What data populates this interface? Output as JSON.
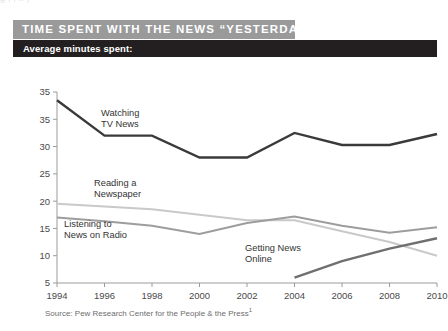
{
  "page": {
    "top_clipped_text": "g  ,            , ff        )"
  },
  "header": {
    "title": "TIME SPENT WITH THE NEWS “YESTERDAY”",
    "subtitle": "Average minutes spent:",
    "title_band_color": "#9a9a9a",
    "subtitle_band_color": "#231f20"
  },
  "footer": {
    "source": "Source: Pew Research Center for the People & the Press",
    "source_footnote_marker": "1"
  },
  "chart_data": {
    "type": "line",
    "title": "TIME SPENT WITH THE NEWS “YESTERDAY”",
    "subtitle": "Average minutes spent:",
    "xlabel": "",
    "ylabel": "",
    "x": [
      1994,
      1996,
      1998,
      2000,
      2002,
      2004,
      2006,
      2008,
      2010
    ],
    "xticklabels": [
      "1994",
      "1996",
      "1998",
      "2000",
      "2002",
      "2004",
      "2006",
      "2008",
      "2010"
    ],
    "yticks": [
      5,
      10,
      15,
      20,
      25,
      30,
      35,
      35
    ],
    "yticklabels": [
      "5",
      "10",
      "15",
      "20",
      "25",
      "30",
      "35",
      "35"
    ],
    "ylim": [
      5,
      40
    ],
    "grid": false,
    "legend_position": "inline-annotations",
    "series": [
      {
        "name": "Watching TV News",
        "color": "#3a3a3a",
        "label_line1": "Watching",
        "label_line2": "TV News",
        "values": [
          38.5,
          32.0,
          32.0,
          28.0,
          28.0,
          32.5,
          30.3,
          30.3,
          32.3
        ]
      },
      {
        "name": "Reading a Newspaper",
        "color": "#c9c9c9",
        "label_line1": "Reading a",
        "label_line2": "Newspaper",
        "values": [
          19.5,
          19.0,
          18.5,
          17.5,
          16.5,
          16.5,
          14.5,
          12.5,
          10.0
        ]
      },
      {
        "name": "Listening to News on Radio",
        "color": "#9d9d9d",
        "label_line1": "Listening to",
        "label_line2": "News on Radio",
        "values": [
          17.0,
          16.3,
          15.5,
          14.0,
          16.0,
          17.2,
          15.5,
          14.2,
          15.2
        ]
      },
      {
        "name": "Getting News Online",
        "color": "#6f6f6f",
        "label_line1": "Getting News",
        "label_line2": "Online",
        "values": [
          null,
          null,
          null,
          null,
          null,
          6.0,
          9.0,
          11.3,
          13.2
        ]
      }
    ]
  }
}
